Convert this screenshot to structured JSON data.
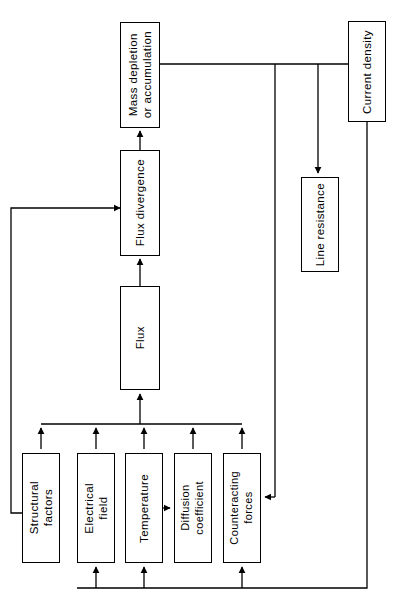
{
  "diagram": {
    "background_color": "#ffffff",
    "line_color": "#000000",
    "orientation": "rotated-90-vertical-text",
    "nodes": [
      {
        "id": "mass-depletion",
        "label": "Mass depletion\nor accumulation",
        "x": 120,
        "y": 22,
        "w": 40,
        "h": 106
      },
      {
        "id": "flux-divergence",
        "label": "Flux divergence",
        "x": 120,
        "y": 150,
        "w": 40,
        "h": 106
      },
      {
        "id": "flux",
        "label": "Flux",
        "x": 120,
        "y": 286,
        "w": 40,
        "h": 104
      },
      {
        "id": "current-density",
        "label": "Current density",
        "x": 348,
        "y": 21,
        "w": 38,
        "h": 101
      },
      {
        "id": "line-resistance",
        "label": "Line resistance",
        "x": 301,
        "y": 177,
        "w": 38,
        "h": 95
      },
      {
        "id": "structural-factors",
        "label": "Structural\nfactors",
        "x": 22,
        "y": 453,
        "w": 38,
        "h": 110
      },
      {
        "id": "electrical-field",
        "label": "Electrical\nfield",
        "x": 77,
        "y": 453,
        "w": 38,
        "h": 110
      },
      {
        "id": "temperature",
        "label": "Temperature",
        "x": 125,
        "y": 453,
        "w": 38,
        "h": 110
      },
      {
        "id": "diffusion-coefficient",
        "label": "Diffusion\ncoefficient",
        "x": 174,
        "y": 453,
        "w": 38,
        "h": 110
      },
      {
        "id": "counteracting-forces",
        "label": "Counteracting\nforces",
        "x": 223,
        "y": 453,
        "w": 38,
        "h": 110
      }
    ],
    "edges": [
      {
        "id": "flux-to-flux-divergence",
        "from": "flux",
        "to": "flux-divergence",
        "arrow": true
      },
      {
        "id": "flux-divergence-to-mass-depletion",
        "from": "flux-divergence",
        "to": "mass-depletion",
        "arrow": true
      },
      {
        "id": "mass-depletion-to-current-density",
        "from": "mass-depletion",
        "to": "current-density",
        "arrow": false
      },
      {
        "id": "current-density-to-line-resistance",
        "from": "current-density",
        "to": "line-resistance",
        "arrow": true
      },
      {
        "id": "feedback-to-flux-divergence",
        "from": "structural-factors",
        "to": "flux-divergence",
        "arrow": true
      },
      {
        "id": "bus-to-flux",
        "from": "bottom-factors",
        "to": "flux",
        "arrow": true
      },
      {
        "id": "structural-factors-to-bus",
        "from": "structural-factors",
        "to": "bus",
        "arrow": true
      },
      {
        "id": "electrical-field-to-bus",
        "from": "electrical-field",
        "to": "bus",
        "arrow": true
      },
      {
        "id": "temperature-to-bus",
        "from": "temperature",
        "to": "bus",
        "arrow": true
      },
      {
        "id": "diffusion-coefficient-to-bus",
        "from": "diffusion-coefficient",
        "to": "bus",
        "arrow": true
      },
      {
        "id": "counteracting-forces-to-bus",
        "from": "counteracting-forces",
        "to": "bus",
        "arrow": true
      },
      {
        "id": "temperature-to-diffusion-coefficient",
        "from": "temperature",
        "to": "diffusion-coefficient",
        "arrow": true
      },
      {
        "id": "mass-depletion-branch-to-counteracting-forces",
        "from": "mass-depletion",
        "to": "counteracting-forces",
        "arrow": true
      },
      {
        "id": "current-density-to-electrical-field",
        "from": "current-density",
        "to": "electrical-field",
        "arrow": true
      },
      {
        "id": "current-density-to-temperature",
        "from": "current-density",
        "to": "temperature",
        "arrow": true
      },
      {
        "id": "current-density-to-counteracting-forces",
        "from": "current-density",
        "to": "counteracting-forces",
        "arrow": true
      }
    ]
  }
}
